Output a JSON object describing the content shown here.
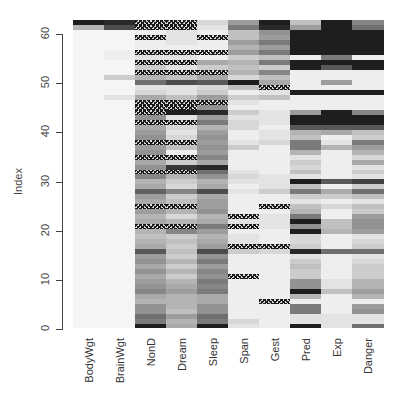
{
  "chart_data": {
    "type": "heatmap",
    "title": "",
    "xlabel": "",
    "ylabel": "Index",
    "columns": [
      "BodyWgt",
      "BrainWgt",
      "NonD",
      "Dream",
      "Sleep",
      "Span",
      "Gest",
      "Pred",
      "Exp",
      "Danger"
    ],
    "y_ticks": [
      0,
      10,
      20,
      30,
      40,
      50,
      60
    ],
    "ylim": [
      0,
      61
    ],
    "n_rows": 62,
    "encoding": "grey level 0=white (low) to 1=black (high); -1 = missing value (NA, hatched)",
    "rows_bottom_to_top": [
      [
        0.02,
        0.02,
        0.95,
        0.35,
        0.95,
        0.1,
        0.05,
        0.95,
        0.1,
        0.6
      ],
      [
        0.02,
        0.02,
        0.55,
        0.3,
        0.55,
        0.15,
        0.05,
        0.1,
        0.1,
        0.1
      ],
      [
        0.02,
        0.02,
        0.6,
        0.4,
        0.6,
        0.05,
        0.05,
        0.1,
        0.1,
        0.1
      ],
      [
        0.02,
        0.02,
        0.45,
        0.25,
        0.45,
        0.05,
        0.05,
        0.55,
        0.05,
        0.45
      ],
      [
        0.02,
        0.02,
        0.45,
        0.3,
        0.45,
        0.05,
        0.05,
        0.55,
        0.05,
        0.4
      ],
      [
        0.02,
        0.02,
        0.3,
        0.3,
        0.35,
        0.05,
        -1,
        0.05,
        0.05,
        0.05
      ],
      [
        0.02,
        0.02,
        0.35,
        0.3,
        0.35,
        0.05,
        0.05,
        0.3,
        0.05,
        0.3
      ],
      [
        0.02,
        0.02,
        0.5,
        0.4,
        0.55,
        0.05,
        0.05,
        0.95,
        0.25,
        0.4
      ],
      [
        0.02,
        0.02,
        0.45,
        0.35,
        0.5,
        0.05,
        0.05,
        0.45,
        0.1,
        0.3
      ],
      [
        0.02,
        0.02,
        0.4,
        0.3,
        0.55,
        0.05,
        0.05,
        0.45,
        0.1,
        0.3
      ],
      [
        0.02,
        0.02,
        0.35,
        0.2,
        0.45,
        -1,
        0.05,
        0.2,
        0.05,
        0.2
      ],
      [
        0.02,
        0.02,
        0.45,
        0.3,
        0.5,
        0.05,
        0.05,
        0.2,
        0.05,
        0.2
      ],
      [
        0.02,
        0.02,
        0.35,
        0.2,
        0.4,
        0.05,
        0.05,
        0.25,
        0.05,
        0.2
      ],
      [
        0.02,
        0.02,
        0.45,
        0.3,
        0.55,
        0.05,
        0.05,
        0.2,
        0.05,
        0.15
      ],
      [
        0.02,
        0.02,
        0.4,
        0.2,
        0.45,
        0.05,
        0.05,
        0.1,
        0.05,
        0.1
      ],
      [
        0.02,
        0.02,
        0.7,
        0.25,
        0.75,
        0.2,
        0.15,
        0.9,
        0.6,
        0.6
      ],
      [
        0.02,
        0.02,
        0.35,
        0.2,
        0.4,
        -1,
        -1,
        0.2,
        0.05,
        0.2
      ],
      [
        0.02,
        0.02,
        0.3,
        0.25,
        0.35,
        0.1,
        0.05,
        0.15,
        0.05,
        0.15
      ],
      [
        0.02,
        0.02,
        0.25,
        0.2,
        0.3,
        0.1,
        0.05,
        0.15,
        0.05,
        0.1
      ],
      [
        0.02,
        0.02,
        0.3,
        0.5,
        0.4,
        0.05,
        0.05,
        0.95,
        0.3,
        0.4
      ],
      [
        0.02,
        0.02,
        -1,
        -1,
        0.55,
        -1,
        0.1,
        0.45,
        0.25,
        0.45
      ],
      [
        0.02,
        0.02,
        0.35,
        0.3,
        0.35,
        0.1,
        0.1,
        0.95,
        0.25,
        0.45
      ],
      [
        0.02,
        0.02,
        0.3,
        0.15,
        0.3,
        -1,
        0.1,
        0.55,
        0.05,
        0.4
      ],
      [
        0.02,
        0.02,
        0.4,
        0.3,
        0.45,
        0.05,
        0.05,
        0.3,
        0.05,
        0.2
      ],
      [
        0.02,
        0.02,
        -1,
        -1,
        0.4,
        0.05,
        -1,
        0.25,
        0.15,
        0.25
      ],
      [
        0.02,
        0.02,
        0.35,
        0.25,
        0.4,
        0.05,
        0.05,
        0.1,
        0.05,
        0.1
      ],
      [
        0.02,
        0.02,
        0.4,
        0.2,
        0.35,
        0.05,
        0.05,
        0.2,
        0.2,
        0.25
      ],
      [
        0.02,
        0.02,
        0.65,
        0.5,
        0.75,
        0.1,
        0.2,
        0.55,
        0.35,
        0.6
      ],
      [
        0.02,
        0.02,
        0.35,
        0.15,
        0.35,
        0.05,
        0.1,
        0.25,
        0.05,
        0.2
      ],
      [
        0.02,
        0.02,
        0.3,
        0.2,
        0.3,
        0.1,
        0.1,
        0.95,
        0.7,
        0.8
      ],
      [
        0.02,
        0.02,
        0.5,
        0.3,
        0.45,
        0.15,
        0.1,
        0.1,
        0.05,
        0.1
      ],
      [
        0.02,
        0.02,
        -1,
        -1,
        0.6,
        0.1,
        0.05,
        0.25,
        0.05,
        0.2
      ],
      [
        0.02,
        0.02,
        0.45,
        0.85,
        0.9,
        0.05,
        0.05,
        0.15,
        0.05,
        0.1
      ],
      [
        0.02,
        0.02,
        0.35,
        0.2,
        0.35,
        0.05,
        0.05,
        0.2,
        0.05,
        0.35
      ],
      [
        0.02,
        0.02,
        -1,
        -1,
        0.5,
        0.05,
        0.05,
        0.1,
        0.05,
        0.15
      ],
      [
        0.02,
        0.02,
        0.45,
        0.05,
        0.4,
        0.05,
        0.05,
        0.3,
        0.05,
        0.3
      ],
      [
        0.02,
        0.02,
        0.4,
        0.25,
        0.45,
        0.2,
        0.05,
        0.55,
        0.3,
        0.4
      ],
      [
        0.02,
        0.02,
        -1,
        -1,
        0.4,
        0.1,
        0.15,
        0.55,
        0.1,
        0.55
      ],
      [
        0.02,
        0.02,
        0.45,
        0.15,
        0.45,
        0.05,
        0.1,
        0.25,
        0.05,
        0.2
      ],
      [
        0.02,
        0.02,
        0.4,
        0.1,
        0.4,
        0.05,
        0.1,
        0.3,
        0.35,
        0.25
      ],
      [
        0.02,
        0.02,
        0.35,
        0.15,
        0.3,
        0.15,
        0.05,
        0.7,
        0.7,
        0.7
      ],
      [
        0.02,
        0.02,
        -1,
        -1,
        0.55,
        0.15,
        0.1,
        0.95,
        0.95,
        0.95
      ],
      [
        0.02,
        0.02,
        0.45,
        0.1,
        0.4,
        0.1,
        0.1,
        0.95,
        0.95,
        0.95
      ],
      [
        0.02,
        0.02,
        -1,
        0.95,
        0.9,
        0.2,
        0.1,
        0.4,
        0.95,
        0.5
      ],
      [
        0.02,
        0.02,
        -1,
        -1,
        0.45,
        0.05,
        0.05,
        0.05,
        0.05,
        0.05
      ],
      [
        0.02,
        0.02,
        -1,
        -1,
        -1,
        0.1,
        0.05,
        0.05,
        0.05,
        0.05
      ],
      [
        0.02,
        0.1,
        0.35,
        0.25,
        0.4,
        0.2,
        0.25,
        0.05,
        0.05,
        0.05
      ],
      [
        0.02,
        0.02,
        0.15,
        0.1,
        0.2,
        0.05,
        0.1,
        0.95,
        0.95,
        0.95
      ],
      [
        0.02,
        0.02,
        0.1,
        0.1,
        0.15,
        0.25,
        -1,
        0.05,
        0.05,
        0.05
      ],
      [
        0.02,
        0.02,
        0.6,
        0.75,
        0.7,
        0.95,
        0.35,
        0.05,
        0.4,
        0.05
      ],
      [
        0.02,
        0.2,
        0.3,
        0.25,
        0.35,
        0.15,
        0.25,
        0.05,
        0.05,
        0.05
      ],
      [
        0.02,
        0.02,
        -1,
        -1,
        -1,
        0.3,
        0.5,
        0.05,
        0.05,
        0.05
      ],
      [
        0.02,
        0.02,
        0.2,
        0.1,
        0.2,
        0.25,
        0.2,
        0.95,
        0.7,
        0.95
      ],
      [
        0.02,
        0.02,
        -1,
        -1,
        0.35,
        0.3,
        0.55,
        0.95,
        0.95,
        0.95
      ],
      [
        0.02,
        0.05,
        0.1,
        0.1,
        0.05,
        0.2,
        0.25,
        0.05,
        0.55,
        0.05
      ],
      [
        0.02,
        0.05,
        -1,
        -1,
        -1,
        0.4,
        0.55,
        0.95,
        0.95,
        0.95
      ],
      [
        0.02,
        0.02,
        0.05,
        0.05,
        0.05,
        0.3,
        0.4,
        0.95,
        0.95,
        0.95
      ],
      [
        0.02,
        0.02,
        0.05,
        0.1,
        0.05,
        0.4,
        0.55,
        0.95,
        0.95,
        0.95
      ],
      [
        0.02,
        0.02,
        -1,
        0.1,
        -1,
        0.25,
        0.4,
        0.95,
        0.95,
        0.95
      ],
      [
        0.02,
        0.02,
        0.05,
        0.1,
        0.05,
        0.25,
        0.45,
        0.95,
        0.95,
        0.95
      ],
      [
        0.3,
        0.75,
        -1,
        -1,
        0.1,
        0.55,
        0.9,
        0.4,
        0.95,
        0.6
      ],
      [
        0.95,
        0.9,
        -1,
        -1,
        0.15,
        0.4,
        0.95,
        0.25,
        0.95,
        0.5
      ]
    ]
  },
  "axis": {
    "ylabel": "Index",
    "yticks": [
      "0",
      "10",
      "20",
      "30",
      "40",
      "50",
      "60"
    ]
  },
  "columns": [
    "BodyWgt",
    "BrainWgt",
    "NonD",
    "Dream",
    "Sleep",
    "Span",
    "Gest",
    "Pred",
    "Exp",
    "Danger"
  ]
}
